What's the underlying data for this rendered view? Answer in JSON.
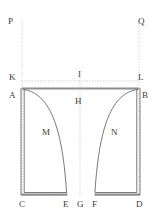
{
  "figure": {
    "background_color": "#ffffff",
    "stroke_color": "#5a5a5a",
    "thick_stroke_color": "#8c8c8c",
    "dotted_color": "#b5b5b5",
    "label_color": "#3b3b3b",
    "width": 161,
    "height": 219
  },
  "labels": {
    "p": "P",
    "q": "Q",
    "k": "K",
    "i": "I",
    "l": "L",
    "a": "A",
    "h": "H",
    "b": "B",
    "m": "M",
    "n": "N",
    "c": "C",
    "e": "E",
    "g": "G",
    "f": "F",
    "d": "D"
  },
  "points": {
    "P": {
      "x": 22,
      "y": 22
    },
    "Q": {
      "x": 139,
      "y": 22
    },
    "K": {
      "x": 22,
      "y": 81
    },
    "I": {
      "x": 80,
      "y": 81
    },
    "L": {
      "x": 139,
      "y": 81
    },
    "A": {
      "x": 22,
      "y": 88
    },
    "H": {
      "x": 80,
      "y": 88
    },
    "B": {
      "x": 139,
      "y": 88
    },
    "C": {
      "x": 22,
      "y": 195
    },
    "E": {
      "x": 67,
      "y": 195
    },
    "G": {
      "x": 80,
      "y": 195
    },
    "F": {
      "x": 95,
      "y": 195
    },
    "D": {
      "x": 139,
      "y": 195
    },
    "M": {
      "x": 47,
      "y": 132
    },
    "N": {
      "x": 114,
      "y": 132
    }
  }
}
